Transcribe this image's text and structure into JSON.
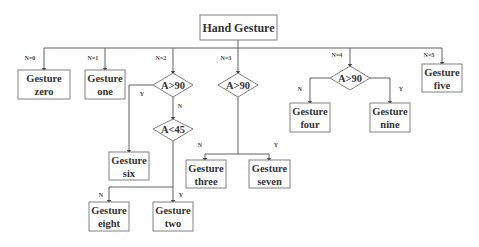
{
  "diagram": {
    "root": {
      "label": "Hand Gesture"
    },
    "branch_labels": {
      "n0": "N=0",
      "n1": "N=1",
      "n2": "N=2",
      "n3": "N=3",
      "n4": "N=4",
      "n5": "N=5"
    },
    "decisions": {
      "d_n2": "A>90",
      "d_n2b": "A<45",
      "d_n3": "A>90",
      "d_n4": "A>90"
    },
    "edge_labels": {
      "d_n2_yes": "Y",
      "d_n2_no": "N",
      "d_n2b_no": "N",
      "d_n2b_yes": "Y",
      "d_n3_no": "N",
      "d_n3_yes": "Y",
      "d_n4_no": "N",
      "d_n4_yes": "Y"
    },
    "leaves": {
      "zero": {
        "line1": "Gesture",
        "line2": "zero"
      },
      "one": {
        "line1": "Gesture",
        "line2": "one"
      },
      "six": {
        "line1": "Gesture",
        "line2": "six"
      },
      "eight": {
        "line1": "Gesture",
        "line2": "eight"
      },
      "two": {
        "line1": "Gesture",
        "line2": "two"
      },
      "three": {
        "line1": "Gesture",
        "line2": "three"
      },
      "seven": {
        "line1": "Gesture",
        "line2": "seven"
      },
      "four": {
        "line1": "Gesture",
        "line2": "four"
      },
      "nine": {
        "line1": "Gesture",
        "line2": "nine"
      },
      "five": {
        "line1": "Gesture",
        "line2": "five"
      }
    }
  }
}
